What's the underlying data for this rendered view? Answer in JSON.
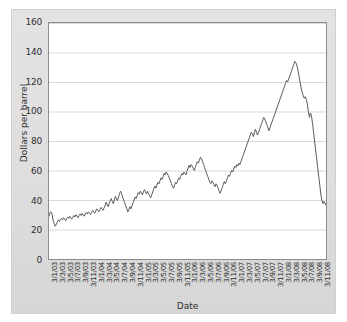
{
  "chart_data": {
    "type": "line",
    "title": "",
    "xlabel": "Date",
    "ylabel": "Dollars per barrel",
    "ylim": [
      0,
      160
    ],
    "yticks": [
      0,
      20,
      40,
      60,
      80,
      100,
      120,
      140,
      160
    ],
    "grid": true,
    "legend": "none",
    "line_color": "#595959",
    "x_tick_labels": [
      "3/1/03",
      "3/3/03",
      "3/5/03",
      "3/7/03",
      "3/9/03",
      "3/11/03",
      "3/1/04",
      "3/3/04",
      "3/5/04",
      "3/7/04",
      "3/9/04",
      "3/11/04",
      "3/1/05",
      "3/3/05",
      "3/5/05",
      "3/7/05",
      "3/9/05",
      "3/11/05",
      "3/1/06",
      "3/3/06",
      "3/5/06",
      "3/7/06",
      "3/9/06",
      "3/11/06",
      "3/1/07",
      "3/3/07",
      "3/5/07",
      "3/7/07",
      "3/9/07",
      "3/11/07",
      "3/1/08",
      "3/3/08",
      "3/5/08",
      "3/7/08",
      "3/9/08",
      "3/11/08"
    ],
    "series": [
      {
        "name": "Crude oil price",
        "values": [
          29.0,
          31.5,
          32.0,
          30.5,
          26.0,
          24.0,
          22.2,
          23.5,
          25.0,
          26.5,
          25.5,
          26.8,
          27.5,
          26.5,
          28.0,
          27.0,
          26.0,
          27.5,
          28.5,
          27.5,
          29.0,
          28.0,
          27.0,
          28.2,
          29.5,
          28.5,
          30.0,
          29.0,
          28.0,
          29.5,
          30.5,
          29.5,
          31.0,
          30.0,
          29.0,
          30.5,
          31.5,
          30.5,
          32.0,
          31.0,
          30.0,
          31.5,
          33.0,
          32.0,
          31.0,
          32.5,
          34.0,
          33.0,
          32.0,
          33.5,
          35.0,
          34.0,
          33.0,
          34.5,
          36.0,
          38.5,
          37.0,
          35.5,
          37.5,
          39.5,
          41.0,
          39.0,
          37.5,
          40.0,
          42.5,
          41.0,
          39.5,
          42.0,
          44.5,
          46.0,
          44.0,
          42.0,
          40.0,
          38.0,
          36.0,
          34.0,
          32.0,
          33.5,
          35.5,
          34.0,
          36.0,
          38.0,
          40.0,
          42.0,
          41.0,
          43.0,
          45.0,
          44.0,
          46.0,
          45.0,
          43.5,
          45.5,
          47.0,
          45.5,
          44.0,
          46.0,
          44.5,
          43.0,
          41.5,
          43.5,
          45.5,
          47.5,
          49.5,
          48.0,
          50.0,
          52.0,
          51.0,
          53.0,
          55.0,
          54.0,
          56.0,
          58.0,
          57.0,
          59.0,
          58.0,
          56.5,
          55.0,
          53.0,
          51.0,
          49.5,
          48.0,
          50.0,
          52.0,
          51.0,
          53.0,
          55.0,
          54.0,
          56.0,
          58.0,
          57.0,
          59.0,
          58.0,
          57.0,
          59.5,
          61.5,
          63.5,
          62.0,
          64.0,
          63.0,
          61.5,
          60.0,
          62.0,
          64.0,
          66.0,
          65.0,
          67.0,
          69.0,
          68.0,
          66.0,
          64.0,
          62.0,
          60.0,
          58.0,
          56.0,
          54.0,
          52.0,
          51.0,
          53.0,
          52.0,
          50.5,
          49.0,
          51.0,
          50.0,
          48.0,
          46.0,
          44.5,
          46.5,
          48.5,
          50.5,
          52.5,
          51.0,
          53.0,
          55.0,
          57.0,
          56.0,
          58.0,
          60.0,
          59.0,
          61.0,
          63.0,
          62.0,
          64.0,
          63.0,
          65.0,
          64.0,
          66.0,
          68.0,
          70.0,
          72.0,
          74.0,
          76.0,
          78.0,
          80.0,
          82.0,
          84.0,
          86.0,
          85.0,
          83.0,
          85.5,
          88.0,
          86.0,
          84.0,
          86.0,
          88.0,
          90.0,
          92.0,
          94.0,
          96.0,
          95.0,
          93.0,
          91.0,
          89.0,
          87.0,
          89.0,
          91.0,
          93.0,
          95.0,
          97.0,
          99.0,
          101.0,
          103.0,
          105.0,
          107.0,
          109.0,
          111.0,
          113.0,
          115.0,
          117.0,
          119.0,
          121.0,
          120.0,
          122.0,
          124.0,
          126.0,
          128.0,
          130.0,
          132.0,
          134.0,
          133.0,
          131.0,
          128.0,
          124.0,
          120.0,
          116.0,
          113.0,
          111.0,
          109.0,
          110.0,
          108.0,
          105.0,
          100.0,
          96.0,
          99.0,
          97.0,
          92.0,
          86.0,
          80.0,
          74.0,
          68.0,
          62.0,
          56.0,
          50.0,
          44.0,
          40.0,
          37.5,
          39.0,
          38.0,
          36.5
        ]
      }
    ]
  }
}
